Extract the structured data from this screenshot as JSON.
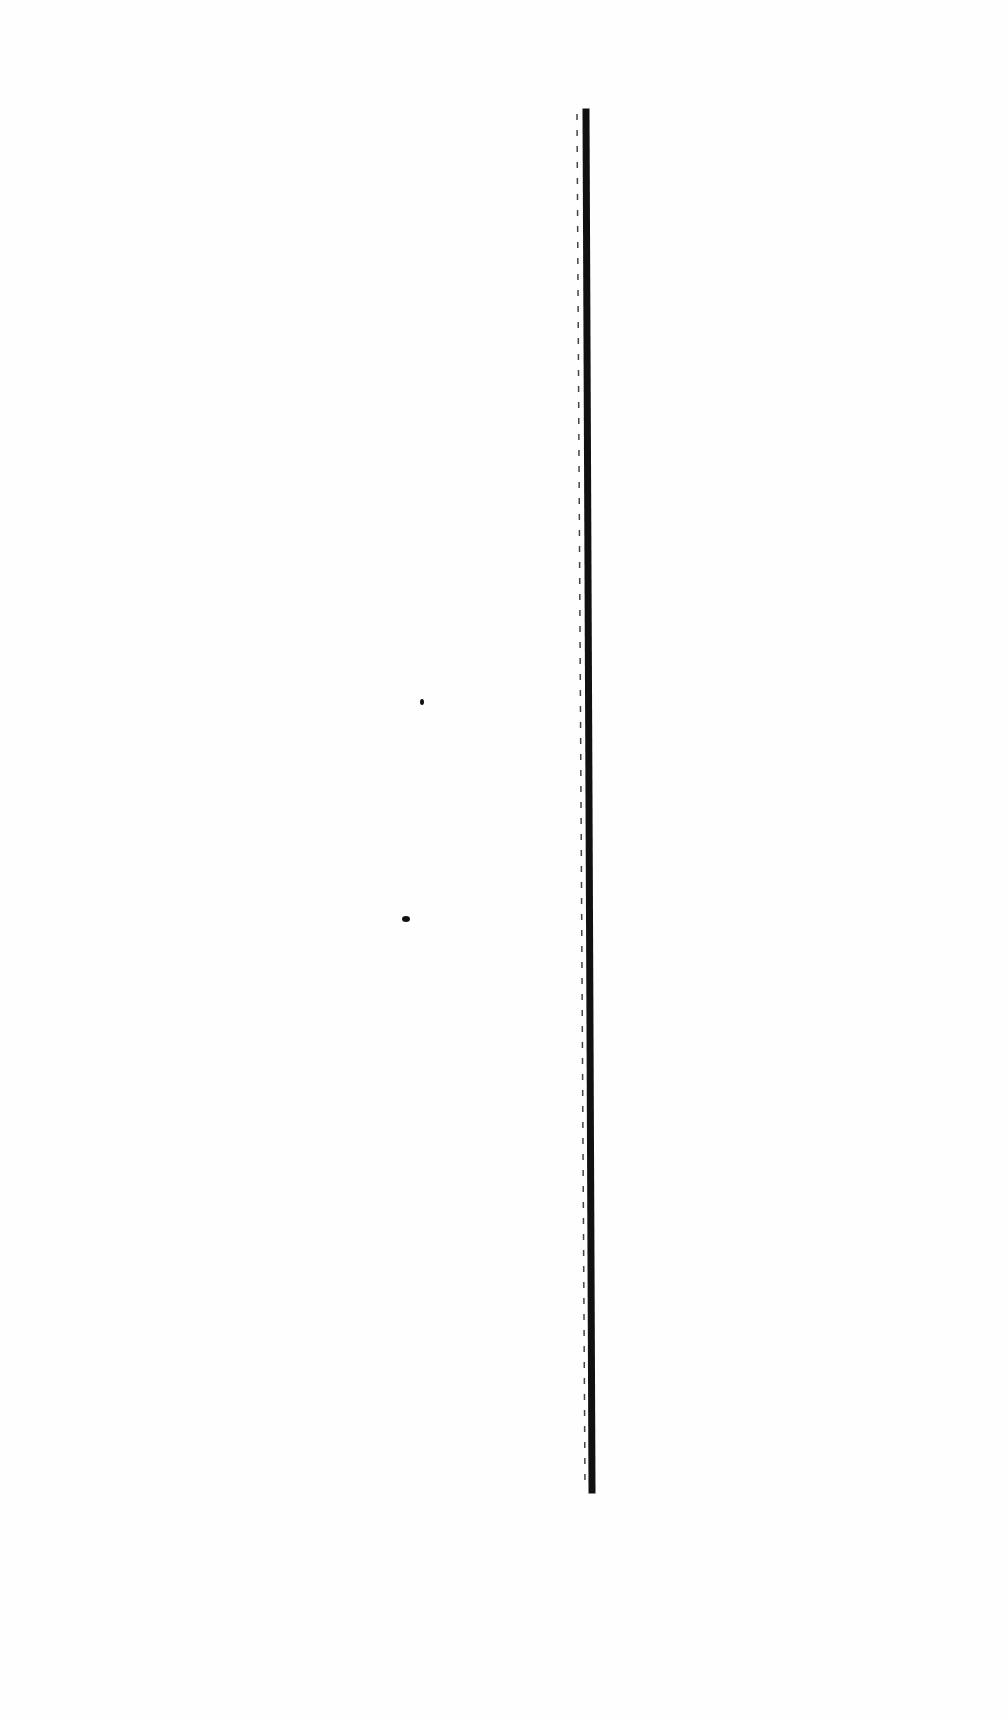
{
  "page": {
    "background": "#fefefe",
    "ink_color": "#111111"
  },
  "marks": {
    "thick_line": {
      "x1": 586,
      "y1": 112,
      "x2": 592,
      "y2": 1490,
      "width": 7
    },
    "dashed_line": {
      "x1": 577,
      "y1": 114,
      "x2": 585,
      "y2": 1488,
      "width": 1.5,
      "dash": "6 10"
    },
    "specks": [
      {
        "x": 422,
        "y": 702,
        "rx": 2,
        "ry": 3
      },
      {
        "x": 406,
        "y": 919,
        "rx": 4,
        "ry": 3
      }
    ]
  }
}
